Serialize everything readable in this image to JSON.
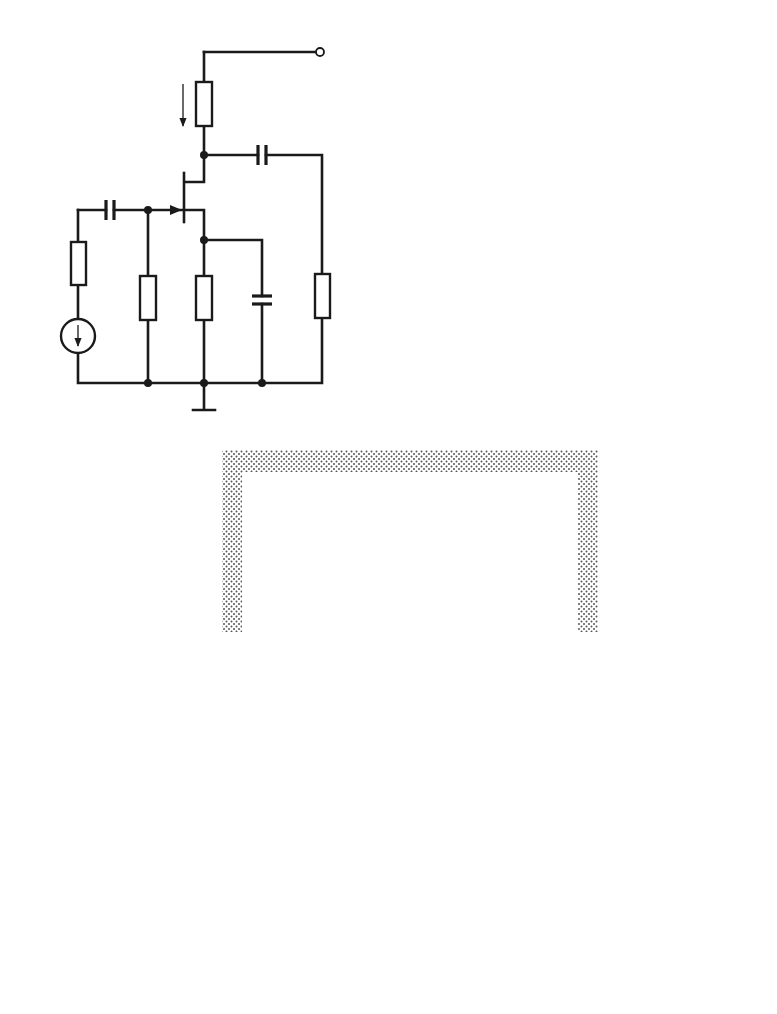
{
  "figure": {
    "panels": [
      {
        "id": "a",
        "label": "a)",
        "title": "JFET common-source amplifier circuit",
        "components": {
          "supply": {
            "label": "U",
            "sub": "B"
          },
          "drain_current": {
            "label": "I",
            "sub": "d"
          },
          "RD": {
            "label": "R",
            "sub": "D"
          },
          "CK_out": {
            "label": "C",
            "sub": "K"
          },
          "CK_in": {
            "label": "C",
            "sub": "K"
          },
          "RG": {
            "label": "R",
            "sub": "G"
          },
          "uG": {
            "label": "u",
            "sub": "G"
          },
          "R1": {
            "label": "R",
            "sub": "1"
          },
          "RS": {
            "label": "R",
            "sub": "S"
          },
          "CS": {
            "label": "C",
            "sub": "S"
          },
          "RL": {
            "label": "R",
            "sub": "L"
          }
        }
      },
      {
        "id": "b",
        "label": "b)",
        "title": "Small-signal equivalent circuit",
        "components": {
          "RG": {
            "label": "R",
            "sub": "G"
          },
          "uG": {
            "label": "u",
            "sub": "G"
          },
          "R1": {
            "label": "R",
            "sub": "1"
          },
          "G": {
            "label": "G"
          },
          "S_left": {
            "label": "S"
          },
          "Ugs": {
            "label": "U",
            "sub": "gs"
          },
          "ri": {
            "label": "r",
            "sub": "i"
          },
          "Ci": {
            "label": "C",
            "sub": "i"
          },
          "i": {
            "label": "i"
          },
          "Cgd": {
            "label": "C",
            "sub": "gd"
          },
          "gmUgs": {
            "label_g": "g",
            "sub_m": "m",
            "label_U": "U",
            "sub_gs": "gs"
          },
          "u2": {
            "label": "u",
            "sub": "2"
          },
          "Cds": {
            "label": "C",
            "sub": "ds"
          },
          "rd": {
            "label": "r",
            "sub": "d"
          },
          "D": {
            "label": "D"
          },
          "S_right": {
            "label": "S"
          },
          "RD": {
            "label": "R",
            "sub": "D"
          },
          "RL": {
            "label": "R",
            "sub": "L"
          },
          "RL_prime": {
            "label": "R",
            "sub": "L",
            "prime": "′"
          }
        }
      },
      {
        "id": "c",
        "label": "c)",
        "title": "Miller-equivalent circuit",
        "components": {
          "RG": {
            "label": "R",
            "sub": "G"
          },
          "uG": {
            "label": "u",
            "sub": "G"
          },
          "R1": {
            "label": "R",
            "sub": "1"
          },
          "ri": {
            "label": "r",
            "sub": "i"
          },
          "Ci": {
            "label": "C",
            "sub": "i"
          },
          "Ugs": {
            "label": "U",
            "sub": "gs"
          },
          "miller_in": {
            "text": "C",
            "sub1": "gd",
            "mid": "(1+g",
            "sub2": "m",
            "tail": "R",
            "sub3": "L",
            "prime": "′",
            "close": ")"
          },
          "miller_out_num": {
            "text": "C",
            "sub1": "gd",
            "mid": "(1+g",
            "sub2": "m",
            "tail": "R",
            "sub3": "L",
            "prime": "′",
            "close": ")"
          },
          "miller_out_den": {
            "text": "g",
            "sub1": "m",
            "tail": "R",
            "sub2": "L",
            "prime": "′"
          },
          "gmUgs": {
            "label_g": "g",
            "sub_m": "m",
            "label_U": "U",
            "sub_gs": "gs"
          },
          "RL_prime": {
            "label": "R",
            "sub": "L",
            "prime": "′"
          }
        }
      }
    ]
  }
}
